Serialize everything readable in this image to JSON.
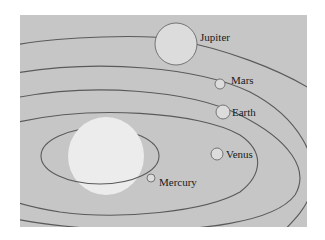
{
  "colors": {
    "page_background": "#ffffff",
    "panel_background": "#c6c6c6",
    "sun_fill": "#ececec",
    "planet_fill": "#dcdcdc",
    "orbit_stroke": "#5a5a5a",
    "label_text": "#1a1a1a"
  },
  "sun": {
    "name": "Sun",
    "labeled": false
  },
  "planets": [
    {
      "name": "Mercury",
      "label": "Mercury"
    },
    {
      "name": "Venus",
      "label": "Venus"
    },
    {
      "name": "Earth",
      "label": "Earth"
    },
    {
      "name": "Mars",
      "label": "Mars"
    },
    {
      "name": "Jupiter",
      "label": "Jupiter"
    }
  ]
}
